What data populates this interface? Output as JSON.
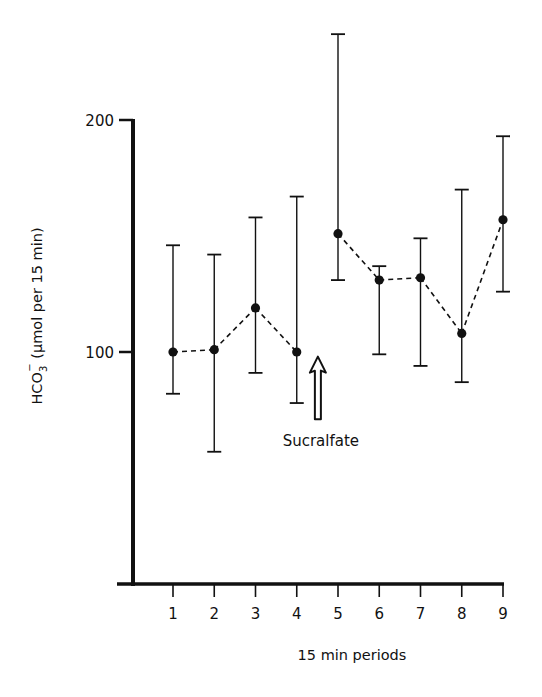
{
  "chart_data": {
    "type": "line",
    "title": "",
    "xlabel": "15 min periods",
    "ylabel": "HCO3⁻ (μmol per 15 min)",
    "ylabel_parts": {
      "main": "HCO",
      "sub": "3",
      "sup": "−",
      "rest": " (μmol per 15 min)"
    },
    "x": [
      1,
      2,
      3,
      4,
      5,
      6,
      7,
      8,
      9
    ],
    "x_tick_labels": [
      "1",
      "2",
      "3",
      "4",
      "5",
      "6",
      "7",
      "8",
      "9"
    ],
    "y_ticks": [
      100,
      200
    ],
    "y_tick_labels": [
      "100",
      "200"
    ],
    "ylim": [
      0,
      240
    ],
    "grid": false,
    "legend": null,
    "series": [
      {
        "name": "HCO3 output (mean ± error)",
        "line_style": "dashed",
        "marker": "filled-circle",
        "values": [
          100,
          101,
          119,
          100,
          151,
          131,
          132,
          108,
          157
        ],
        "error_upper": [
          146,
          142,
          158,
          167,
          237,
          137,
          149,
          170,
          193
        ],
        "error_lower": [
          82,
          57,
          91,
          78,
          131,
          99,
          94,
          87,
          126
        ]
      }
    ],
    "segments_break_after_x": 4,
    "annotations": [
      {
        "text": "Sucralfate",
        "type": "hollow-up-arrow",
        "x": 4.5,
        "arrow_y_top": 98,
        "arrow_y_bottom": 71
      }
    ]
  },
  "labels": {
    "x_axis_title": "15 min periods",
    "y_axis_title_main": "HCO",
    "y_axis_title_sub": "3",
    "y_axis_title_sup": "−",
    "y_axis_title_rest": " (μmol per 15 min)",
    "annotation": "Sucralfate"
  },
  "colors": {
    "ink": "#111111",
    "background": "#ffffff"
  }
}
